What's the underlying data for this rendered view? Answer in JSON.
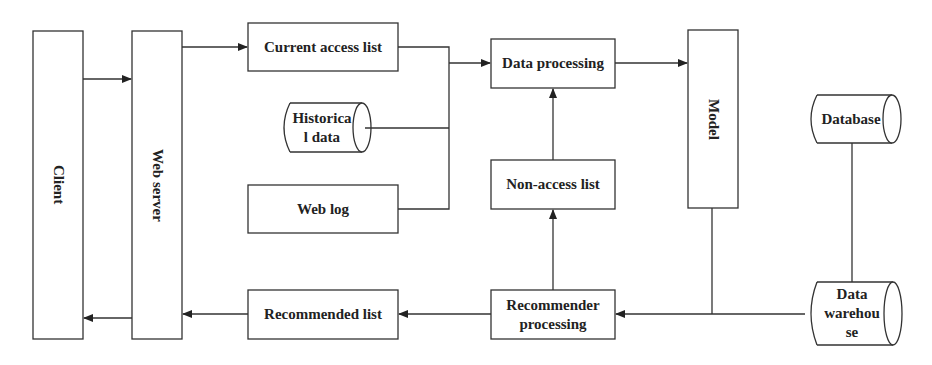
{
  "diagram": {
    "type": "flowchart",
    "nodes": {
      "client": {
        "label": "Client",
        "shape": "rect",
        "orientation": "vertical"
      },
      "web_server": {
        "label": "Web server",
        "shape": "rect",
        "orientation": "vertical"
      },
      "current_access_list": {
        "label": "Current access list",
        "shape": "rect"
      },
      "historical_data": {
        "label": "Historica l data",
        "line1": "Historica",
        "line2": "l data",
        "shape": "cylinder"
      },
      "web_log": {
        "label": "Web log",
        "shape": "rect"
      },
      "data_processing": {
        "label": "Data processing",
        "shape": "rect"
      },
      "non_access_list": {
        "label": "Non-access list",
        "shape": "rect"
      },
      "model": {
        "label": "Model",
        "shape": "rect",
        "orientation": "vertical"
      },
      "database": {
        "label": "Database",
        "shape": "cylinder"
      },
      "recommended_list": {
        "label": "Recommended list",
        "shape": "rect"
      },
      "recommender_processing": {
        "label": "Recommender processing",
        "line1": "Recommender",
        "line2": "processing",
        "shape": "rect"
      },
      "data_warehouse": {
        "label": "Data warehouse",
        "line1": "Data",
        "line2": "warehou",
        "line3": "se",
        "shape": "cylinder"
      }
    },
    "edges": [
      {
        "from": "Client",
        "to": "Web server",
        "arrow": true
      },
      {
        "from": "Web server",
        "to": "Current access list",
        "arrow": true
      },
      {
        "from": "Current access list",
        "to": "Data processing",
        "arrow": true,
        "via": "merge bus"
      },
      {
        "from": "Historical data",
        "to": "Data processing",
        "arrow": true,
        "via": "merge bus"
      },
      {
        "from": "Web log",
        "to": "Data processing",
        "arrow": true,
        "via": "merge bus"
      },
      {
        "from": "Data processing",
        "to": "Model",
        "arrow": true
      },
      {
        "from": "Non-access list",
        "to": "Data processing",
        "arrow": true
      },
      {
        "from": "Recommender processing",
        "to": "Non-access list",
        "arrow": true
      },
      {
        "from": "Model",
        "to": "Recommender processing",
        "arrow": true,
        "via": "bottom line"
      },
      {
        "from": "Database",
        "to": "Data warehouse",
        "arrow": false
      },
      {
        "from": "Data warehouse",
        "to": "Recommender processing",
        "arrow": true
      },
      {
        "from": "Recommender processing",
        "to": "Recommended list",
        "arrow": true
      },
      {
        "from": "Recommended list",
        "to": "Web server",
        "arrow": true
      },
      {
        "from": "Web server",
        "to": "Client",
        "arrow": true
      }
    ],
    "colors": {
      "stroke": "#333333",
      "text": "#222222",
      "background": "#ffffff"
    }
  }
}
